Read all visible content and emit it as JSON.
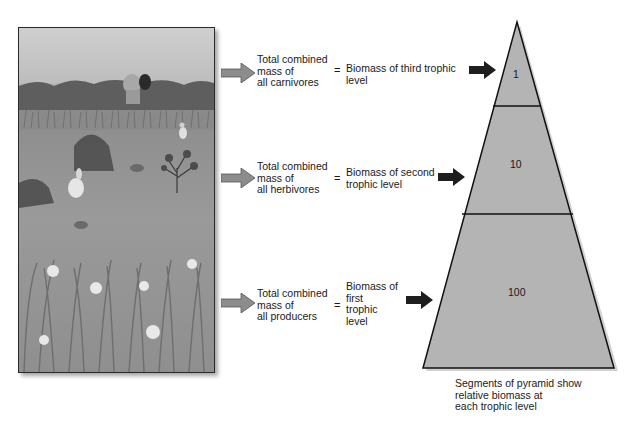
{
  "scene": {
    "description": "Illustrated grassland ecosystem with carnivore (wolf), herbivores (rabbit, birds, rodents) and producers (grasses, flowers)",
    "icons": [
      "wolf-icon",
      "rabbit-icon",
      "bird-icon",
      "rodent-icon",
      "shrub-icon",
      "grass-icon",
      "flower-icon"
    ]
  },
  "rows": [
    {
      "group_label": "Total combined\nmass of\nall carnivores",
      "equals": "=",
      "biomass_label": "Biomass of third trophic\nlevel",
      "level_value": "1"
    },
    {
      "group_label": "Total combined\nmass of\nall herbivores",
      "equals": "=",
      "biomass_label": "Biomass of second\ntrophic level",
      "level_value": "10"
    },
    {
      "group_label": "Total combined\nmass of\nall producers",
      "equals": "=",
      "biomass_label": "Biomass of\nfirst\ntrophic\nlevel",
      "level_value": "100"
    }
  ],
  "pyramid": {
    "segments": [
      {
        "level": "third trophic level",
        "value": "1"
      },
      {
        "level": "second trophic level",
        "value": "10"
      },
      {
        "level": "first trophic level",
        "value": "100"
      }
    ],
    "fill": "#b4b4b4",
    "stroke": "#111111"
  },
  "caption": "Segments of pyramid show\nrelative biomass at\neach trophic level"
}
